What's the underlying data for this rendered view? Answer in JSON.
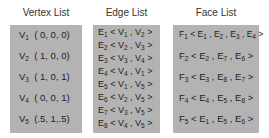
{
  "vertex_list": {
    "title": "Vertex List",
    "items": [
      {
        "label": "V",
        "sub": "1",
        "value": "( 0, 0, 0)"
      },
      {
        "label": "V",
        "sub": "2",
        "value": "( 1, 0, 0)"
      },
      {
        "label": "V",
        "sub": "3",
        "value": "( 1, 0, 1)"
      },
      {
        "label": "V",
        "sub": "4",
        "value": "( 0, 0, 1)"
      },
      {
        "label": "V",
        "sub": "5",
        "value": "(.5, 1,.5)"
      }
    ]
  },
  "edge_list": {
    "title": "Edge List",
    "items": [
      {
        "label": "E",
        "sub": "1",
        "a": "1",
        "b": "2"
      },
      {
        "label": "E",
        "sub": "2",
        "a": "2",
        "b": "3"
      },
      {
        "label": "E",
        "sub": "3",
        "a": "3",
        "b": "4"
      },
      {
        "label": "E",
        "sub": "4",
        "a": "4",
        "b": "1"
      },
      {
        "label": "E",
        "sub": "5",
        "a": "1",
        "b": "5"
      },
      {
        "label": "E",
        "sub": "6",
        "a": "2",
        "b": "5"
      },
      {
        "label": "E",
        "sub": "7",
        "a": "3",
        "b": "5"
      },
      {
        "label": "E",
        "sub": "8",
        "a": "4",
        "b": "5"
      }
    ]
  },
  "face_list": {
    "title": "Face List",
    "items": [
      {
        "label": "F",
        "sub": "1",
        "edges": [
          "1",
          "2",
          "3",
          "4"
        ]
      },
      {
        "label": "F",
        "sub": "2",
        "edges": [
          "2",
          "7",
          "6"
        ]
      },
      {
        "label": "F",
        "sub": "3",
        "edges": [
          "3",
          "8",
          "7"
        ]
      },
      {
        "label": "F",
        "sub": "4",
        "edges": [
          "4",
          "5",
          "8"
        ]
      },
      {
        "label": "F",
        "sub": "5",
        "edges": [
          "1",
          "5",
          "6"
        ]
      }
    ]
  },
  "colors": {
    "box_fill": "#b3b3b3",
    "text": "#222222"
  }
}
